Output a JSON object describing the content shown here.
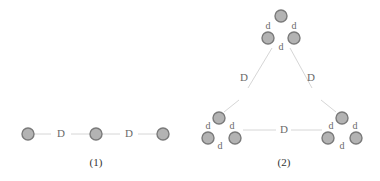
{
  "diagram": {
    "panel1": {
      "caption": "(1)",
      "edge_labels": [
        "D",
        "D"
      ]
    },
    "panel2": {
      "caption": "(2)",
      "large_edge_labels": [
        "D",
        "D",
        "D"
      ],
      "cluster_edge_label": "d"
    },
    "colors": {
      "node_fill": "#b3b3b3",
      "node_stroke": "#7a7a7a",
      "edge": "#d6d6d6",
      "label": "#6a6a6a"
    }
  }
}
